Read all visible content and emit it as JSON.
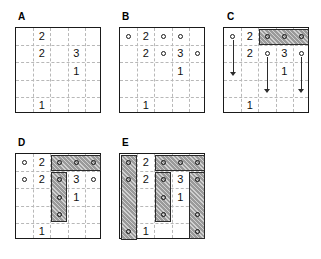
{
  "figure": {
    "panel_count": 5,
    "grid_size": 5
  },
  "colors": {
    "grid_border": "#1a1a1a",
    "grid_dashes": "#b8b8b8",
    "shade_fill": "#9a9a9a",
    "shade_border": "#2b2b2b",
    "number_color": "#111111",
    "dot_border": "#1a1a1a",
    "arrow_color": "#2b2b2b",
    "background": "#ffffff"
  },
  "panels": [
    {
      "label": "A",
      "label_x": 18,
      "label_y": 12,
      "grid_x": 15,
      "grid_y": 27,
      "grid_w": 86,
      "grid_h": 86,
      "numbers": [
        {
          "row": 1,
          "col": 2,
          "value": "2"
        },
        {
          "row": 2,
          "col": 2,
          "value": "2"
        },
        {
          "row": 2,
          "col": 4,
          "value": "3"
        },
        {
          "row": 3,
          "col": 4,
          "value": "1"
        },
        {
          "row": 5,
          "col": 2,
          "value": "1"
        }
      ],
      "dots": [],
      "shades": [],
      "arrows": []
    },
    {
      "label": "B",
      "label_x": 122,
      "label_y": 12,
      "grid_x": 119,
      "grid_y": 27,
      "grid_w": 86,
      "grid_h": 86,
      "numbers": [
        {
          "row": 1,
          "col": 2,
          "value": "2"
        },
        {
          "row": 2,
          "col": 2,
          "value": "2"
        },
        {
          "row": 2,
          "col": 4,
          "value": "3"
        },
        {
          "row": 3,
          "col": 4,
          "value": "1"
        },
        {
          "row": 5,
          "col": 2,
          "value": "1"
        }
      ],
      "dots": [
        {
          "row": 1,
          "col": 1
        },
        {
          "row": 1,
          "col": 3
        },
        {
          "row": 1,
          "col": 4
        },
        {
          "row": 2,
          "col": 3
        },
        {
          "row": 2,
          "col": 5
        }
      ],
      "shades": [],
      "arrows": []
    },
    {
      "label": "C",
      "label_x": 227,
      "label_y": 12,
      "grid_x": 223,
      "grid_y": 27,
      "grid_w": 86,
      "grid_h": 86,
      "numbers": [
        {
          "row": 1,
          "col": 2,
          "value": "2"
        },
        {
          "row": 2,
          "col": 2,
          "value": "2"
        },
        {
          "row": 2,
          "col": 4,
          "value": "3"
        },
        {
          "row": 3,
          "col": 4,
          "value": "1"
        },
        {
          "row": 5,
          "col": 2,
          "value": "1"
        }
      ],
      "dots": [
        {
          "row": 1,
          "col": 1
        },
        {
          "row": 1,
          "col": 3,
          "on_shade": true
        },
        {
          "row": 1,
          "col": 4,
          "on_shade": true
        },
        {
          "row": 1,
          "col": 5,
          "on_shade": true
        },
        {
          "row": 2,
          "col": 3
        },
        {
          "row": 2,
          "col": 5
        }
      ],
      "shades": [
        {
          "row": 1,
          "col": 3,
          "rows": 1,
          "cols": 3
        }
      ],
      "arrows": [
        {
          "col": 1,
          "from_row": 1,
          "to_row": 3
        },
        {
          "col": 3,
          "from_row": 2,
          "to_row": 4
        },
        {
          "col": 5,
          "from_row": 2,
          "to_row": 4
        }
      ]
    },
    {
      "label": "D",
      "label_x": 18,
      "label_y": 138,
      "grid_x": 15,
      "grid_y": 153,
      "grid_w": 86,
      "grid_h": 86,
      "numbers": [
        {
          "row": 1,
          "col": 2,
          "value": "2"
        },
        {
          "row": 2,
          "col": 2,
          "value": "2"
        },
        {
          "row": 2,
          "col": 4,
          "value": "3"
        },
        {
          "row": 3,
          "col": 4,
          "value": "1"
        },
        {
          "row": 5,
          "col": 2,
          "value": "1"
        }
      ],
      "dots": [
        {
          "row": 1,
          "col": 1
        },
        {
          "row": 1,
          "col": 3,
          "on_shade": true
        },
        {
          "row": 1,
          "col": 4,
          "on_shade": true
        },
        {
          "row": 1,
          "col": 5,
          "on_shade": true
        },
        {
          "row": 2,
          "col": 1
        },
        {
          "row": 2,
          "col": 3,
          "on_shade": true
        },
        {
          "row": 2,
          "col": 5
        },
        {
          "row": 3,
          "col": 3,
          "on_shade": true
        },
        {
          "row": 4,
          "col": 3,
          "on_shade": true
        }
      ],
      "shades": [
        {
          "row": 1,
          "col": 3,
          "rows": 1,
          "cols": 3
        },
        {
          "row": 2,
          "col": 3,
          "rows": 3,
          "cols": 1
        }
      ],
      "arrows": []
    },
    {
      "label": "E",
      "label_x": 122,
      "label_y": 138,
      "grid_x": 119,
      "grid_y": 153,
      "grid_w": 86,
      "grid_h": 86,
      "numbers": [
        {
          "row": 1,
          "col": 2,
          "value": "2"
        },
        {
          "row": 2,
          "col": 2,
          "value": "2"
        },
        {
          "row": 2,
          "col": 4,
          "value": "3"
        },
        {
          "row": 3,
          "col": 4,
          "value": "1"
        },
        {
          "row": 5,
          "col": 2,
          "value": "1"
        }
      ],
      "dots": [
        {
          "row": 1,
          "col": 1,
          "on_shade": true
        },
        {
          "row": 1,
          "col": 3,
          "on_shade": true
        },
        {
          "row": 1,
          "col": 4,
          "on_shade": true
        },
        {
          "row": 1,
          "col": 5,
          "on_shade": true
        },
        {
          "row": 2,
          "col": 1,
          "on_shade": true
        },
        {
          "row": 2,
          "col": 3,
          "on_shade": true
        },
        {
          "row": 2,
          "col": 5,
          "on_shade": true
        },
        {
          "row": 3,
          "col": 3,
          "on_shade": true
        },
        {
          "row": 4,
          "col": 3,
          "on_shade": true
        },
        {
          "row": 4,
          "col": 5,
          "on_shade": true
        },
        {
          "row": 5,
          "col": 1,
          "on_shade": true
        },
        {
          "row": 5,
          "col": 5,
          "on_shade": true
        }
      ],
      "shades": [
        {
          "row": 1,
          "col": 1,
          "rows": 5,
          "cols": 1
        },
        {
          "row": 1,
          "col": 3,
          "rows": 1,
          "cols": 3
        },
        {
          "row": 2,
          "col": 3,
          "rows": 3,
          "cols": 1
        },
        {
          "row": 2,
          "col": 5,
          "rows": 4,
          "cols": 1
        }
      ],
      "arrows": []
    }
  ]
}
